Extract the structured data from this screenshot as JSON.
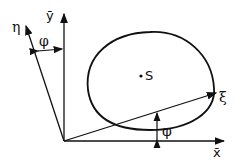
{
  "diagram": {
    "labels": {
      "y_axis": "ȳ",
      "x_axis": "x̄",
      "eta": "η",
      "xi": "ξ",
      "phi_top": "φ",
      "phi_bottom": "φ",
      "centroid": "S"
    },
    "colors": {
      "stroke": "#111111",
      "background": "#ffffff"
    }
  }
}
